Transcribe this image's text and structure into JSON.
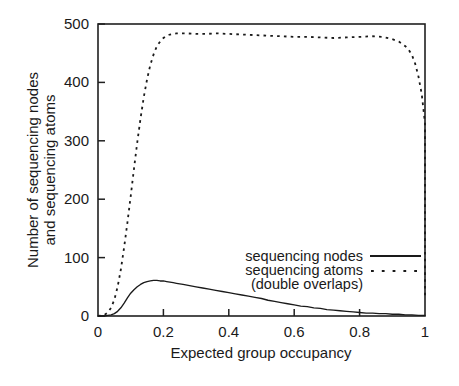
{
  "chart_data": {
    "type": "line",
    "title": "",
    "xlabel": "Expected group occupancy",
    "ylabel_line1": "Number of sequencing nodes",
    "ylabel_line2": "and sequencing atoms",
    "xlim": [
      0,
      1
    ],
    "ylim": [
      0,
      500
    ],
    "xticks": [
      0,
      0.2,
      0.4,
      0.6,
      0.8,
      1
    ],
    "xticklabels": [
      "0",
      "0.2",
      "0.4",
      "0.6",
      "0.8",
      "1"
    ],
    "yticks": [
      0,
      100,
      200,
      300,
      400,
      500
    ],
    "yticklabels": [
      "0",
      "100",
      "200",
      "300",
      "400",
      "500"
    ],
    "grid": false,
    "legend_position": "center-right",
    "legend": [
      {
        "label": "sequencing nodes",
        "style": "solid"
      },
      {
        "label": "sequencing atoms",
        "style": "dashed"
      },
      {
        "label": "(double overlaps)",
        "style": "none"
      }
    ],
    "series": [
      {
        "name": "sequencing nodes",
        "style": "solid",
        "x": [
          0.0,
          0.02,
          0.03,
          0.04,
          0.05,
          0.06,
          0.07,
          0.08,
          0.09,
          0.1,
          0.11,
          0.12,
          0.13,
          0.14,
          0.15,
          0.16,
          0.17,
          0.18,
          0.19,
          0.2,
          0.21,
          0.22,
          0.23,
          0.24,
          0.25,
          0.26,
          0.28,
          0.3,
          0.32,
          0.34,
          0.36,
          0.38,
          0.4,
          0.42,
          0.44,
          0.46,
          0.48,
          0.5,
          0.52,
          0.54,
          0.56,
          0.58,
          0.6,
          0.62,
          0.64,
          0.66,
          0.68,
          0.7,
          0.72,
          0.74,
          0.76,
          0.78,
          0.8,
          0.82,
          0.84,
          0.86,
          0.88,
          0.9,
          0.92,
          0.94,
          0.96,
          0.98,
          1.0
        ],
        "y": [
          0,
          0,
          1,
          2,
          4,
          8,
          14,
          22,
          31,
          39,
          45,
          50,
          54,
          57,
          59,
          60,
          61,
          61,
          60,
          60,
          59,
          58,
          57,
          56,
          55,
          54,
          52,
          50,
          48,
          46,
          44,
          42,
          40,
          38,
          36,
          34,
          32,
          30,
          27,
          25,
          23,
          21,
          19,
          17,
          16,
          14,
          13,
          11,
          10,
          9,
          8,
          7,
          6,
          5,
          5,
          4,
          4,
          3,
          3,
          2,
          2,
          1,
          1
        ]
      },
      {
        "name": "sequencing atoms (double overlaps)",
        "style": "dashed",
        "x": [
          0.0,
          0.02,
          0.03,
          0.04,
          0.05,
          0.06,
          0.07,
          0.08,
          0.09,
          0.1,
          0.11,
          0.12,
          0.13,
          0.14,
          0.15,
          0.16,
          0.17,
          0.18,
          0.19,
          0.2,
          0.21,
          0.22,
          0.23,
          0.24,
          0.25,
          0.27,
          0.3,
          0.33,
          0.36,
          0.4,
          0.44,
          0.48,
          0.52,
          0.56,
          0.6,
          0.64,
          0.68,
          0.72,
          0.76,
          0.8,
          0.84,
          0.87,
          0.9,
          0.92,
          0.94,
          0.95,
          0.96,
          0.97,
          0.98,
          0.99,
          1.0,
          1.0
        ],
        "y": [
          0,
          2,
          6,
          14,
          28,
          50,
          80,
          118,
          160,
          205,
          252,
          297,
          338,
          375,
          405,
          430,
          448,
          462,
          470,
          476,
          480,
          482,
          483,
          484,
          484,
          484,
          483,
          483,
          484,
          483,
          482,
          481,
          480,
          479,
          478,
          478,
          477,
          476,
          477,
          478,
          479,
          478,
          474,
          470,
          462,
          456,
          447,
          432,
          410,
          380,
          330,
          30
        ]
      }
    ]
  },
  "axes_geometry": {
    "left_px": 98,
    "right_px": 425,
    "top_px": 24,
    "bottom_px": 316
  }
}
